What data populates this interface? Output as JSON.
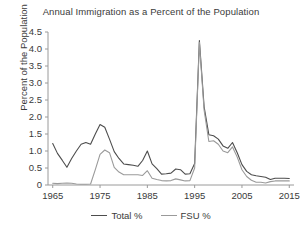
{
  "chart_data": {
    "type": "line",
    "title": "Annual Immigration as a Percent of the Population",
    "xlabel": "",
    "ylabel": "Percent of the Population",
    "xlim": [
      1964,
      2016
    ],
    "ylim": [
      0,
      4.5
    ],
    "grid": false,
    "legend_position": "bottom",
    "xticks": [
      1965,
      1975,
      1985,
      1995,
      2005,
      2015
    ],
    "xtick_labels": [
      "1965",
      "1975",
      "1985",
      "1995",
      "2005",
      "2015"
    ],
    "yticks": [
      0,
      0.5,
      1.0,
      1.5,
      2.0,
      2.5,
      3.0,
      3.5,
      4.0,
      4.5
    ],
    "ytick_labels": [
      "0",
      "0.5",
      "1.0",
      "1.5",
      "2.0",
      "2.5",
      "3.0",
      "3.5",
      "4.0",
      "4.5"
    ],
    "x": [
      1965,
      1966,
      1967,
      1968,
      1969,
      1970,
      1971,
      1972,
      1973,
      1974,
      1975,
      1976,
      1977,
      1978,
      1979,
      1980,
      1981,
      1982,
      1983,
      1984,
      1985,
      1986,
      1987,
      1988,
      1989,
      1990,
      1991,
      1992,
      1993,
      1994,
      1995,
      1996,
      1997,
      1998,
      1999,
      2000,
      2001,
      2002,
      2003,
      2004,
      2005,
      2006,
      2007,
      2008,
      2009,
      2010,
      2011,
      2012,
      2013,
      2014,
      2015
    ],
    "series": [
      {
        "name": "Total %",
        "color": "#4d4d4d",
        "values": [
          1.22,
          0.93,
          0.73,
          0.52,
          0.78,
          1.0,
          1.2,
          1.25,
          1.2,
          1.5,
          1.78,
          1.7,
          1.35,
          0.98,
          0.78,
          0.62,
          0.6,
          0.58,
          0.55,
          0.72,
          1.0,
          0.62,
          0.48,
          0.32,
          0.33,
          0.35,
          0.47,
          0.45,
          0.32,
          0.33,
          0.63,
          4.25,
          2.3,
          1.48,
          1.45,
          1.35,
          1.15,
          1.08,
          1.25,
          0.95,
          0.6,
          0.4,
          0.3,
          0.27,
          0.25,
          0.23,
          0.16,
          0.2,
          0.2,
          0.2,
          0.19
        ]
      },
      {
        "name": "FSU %",
        "color": "#9a9a9a",
        "values": [
          0.05,
          0.04,
          0.05,
          0.06,
          0.05,
          0.03,
          0.02,
          0.02,
          0.03,
          0.45,
          0.9,
          1.03,
          0.95,
          0.52,
          0.38,
          0.3,
          0.3,
          0.3,
          0.3,
          0.28,
          0.42,
          0.2,
          0.16,
          0.13,
          0.12,
          0.13,
          0.18,
          0.15,
          0.12,
          0.13,
          0.5,
          4.2,
          2.2,
          1.28,
          1.3,
          1.2,
          1.0,
          0.95,
          1.12,
          0.82,
          0.45,
          0.25,
          0.14,
          0.08,
          0.08,
          0.06,
          0.1,
          0.12,
          0.12,
          0.12,
          0.12
        ]
      }
    ]
  },
  "legend": {
    "entries": [
      {
        "label": "Total %"
      },
      {
        "label": "FSU %"
      }
    ]
  }
}
